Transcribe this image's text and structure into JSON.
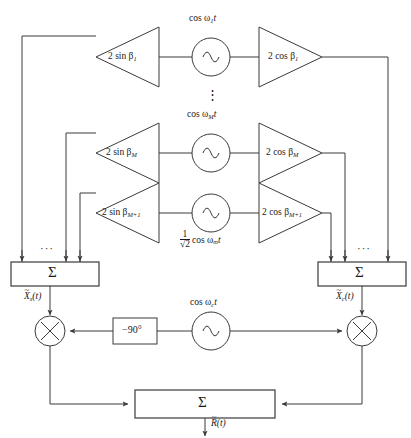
{
  "diagram": {
    "type": "signal-flow-block-diagram",
    "colors": {
      "line": "#3a3a3a",
      "text": "#1a1a1a",
      "background": "#ffffff"
    },
    "branches": [
      {
        "id": "branch-1",
        "sin_gain_label": "2 sin β",
        "sin_gain_sub": "1",
        "oscillator_label": "cos ω",
        "oscillator_sub": "1",
        "oscillator_tail": "t",
        "cos_gain_label": "2 cos β",
        "cos_gain_sub": "1"
      },
      {
        "id": "branch-M",
        "sin_gain_label": "2 sin β",
        "sin_gain_sub": "M",
        "oscillator_label": "cos ω",
        "oscillator_sub": "M",
        "oscillator_tail": "t",
        "cos_gain_label": "2 cos β",
        "cos_gain_sub": "M"
      },
      {
        "id": "branch-M-plus-1",
        "sin_gain_label": "2 sin β",
        "sin_gain_sub": "M+1",
        "oscillator_num": "1",
        "oscillator_den": "√2",
        "oscillator_label": "cos ω",
        "oscillator_sub": "m",
        "oscillator_tail": "t",
        "cos_gain_label": "2 cos β",
        "cos_gain_sub": "M+1"
      }
    ],
    "vertical_ellipsis": "⋮",
    "horizontal_ellipsis_left": "···",
    "horizontal_ellipsis_right": "···",
    "summers": {
      "left_symbol": "Σ",
      "right_symbol": "Σ",
      "output_symbol": "Σ"
    },
    "signals": {
      "left_sum_output": "X",
      "left_sum_output_sub": "s",
      "left_sum_output_tail": "(t)",
      "right_sum_output": "X",
      "right_sum_output_sub": "c",
      "right_sum_output_tail": "(t)",
      "final_output": "R",
      "final_output_tail": "(t)",
      "tilde": "~"
    },
    "multipliers": {
      "left_symbol": "×",
      "right_symbol": "×"
    },
    "phase_shifter": {
      "label": "−90°"
    },
    "carrier": {
      "label": "cos ω",
      "sub": "c",
      "tail": "t"
    }
  }
}
